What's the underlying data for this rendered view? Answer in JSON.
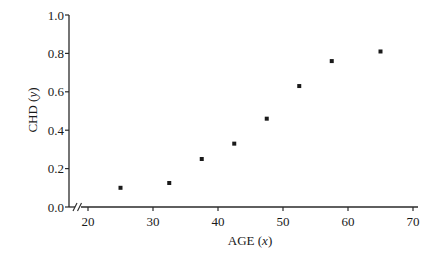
{
  "chart_data": {
    "type": "scatter",
    "title": "",
    "xlabel": "AGE",
    "xlabel_var": "x",
    "ylabel": "CHD",
    "ylabel_var": "y",
    "xlim": [
      16.9,
      71
    ],
    "ylim": [
      0.0,
      1.0
    ],
    "xticks": [
      20,
      30,
      40,
      50,
      60,
      70
    ],
    "yticks": [
      0.0,
      0.2,
      0.4,
      0.6,
      0.8,
      1.0
    ],
    "ytick_labels": [
      "0.0",
      "0.2",
      "0.4",
      "0.6",
      "0.8",
      "1.0"
    ],
    "xtick_labels": [
      "20",
      "30",
      "40",
      "50",
      "60",
      "70"
    ],
    "x_axis_break": true,
    "grid": false,
    "legend": null,
    "marker": "square",
    "series": [
      {
        "name": "CHD proportion by age group",
        "points": [
          {
            "x": 25,
            "y": 0.1
          },
          {
            "x": 32.5,
            "y": 0.125
          },
          {
            "x": 37.5,
            "y": 0.25
          },
          {
            "x": 42.5,
            "y": 0.33
          },
          {
            "x": 47.5,
            "y": 0.46
          },
          {
            "x": 52.5,
            "y": 0.63
          },
          {
            "x": 57.5,
            "y": 0.76
          },
          {
            "x": 65,
            "y": 0.81
          }
        ]
      }
    ]
  },
  "colors": {
    "axis": "#2a2a2a",
    "marker": "#1a1a1a",
    "background": "#ffffff"
  }
}
